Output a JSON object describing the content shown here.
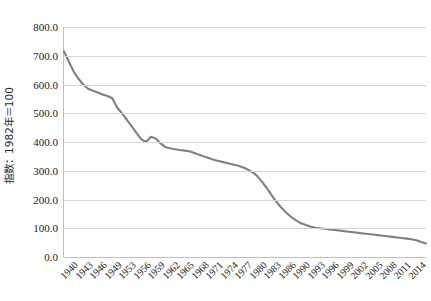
{
  "chart_data": {
    "type": "line",
    "title": "",
    "subtitle": "",
    "xlabel": "",
    "ylabel": "指数：1982年＝100",
    "ylim": [
      0,
      800
    ],
    "ytick_labels": [
      "800.0",
      "700.0",
      "600.0",
      "500.0",
      "400.0",
      "300.0",
      "200.0",
      "100.0",
      "0.0"
    ],
    "ytick_values": [
      800,
      700,
      600,
      500,
      400,
      300,
      200,
      100,
      0
    ],
    "grid": true,
    "legend": "none",
    "line_color": "#808080",
    "grid_color": "#d5d5d5",
    "axis_color": "#bfbfbf",
    "xtick_labels": [
      "1940",
      "1943",
      "1946",
      "1949",
      "1953",
      "1956",
      "1959",
      "1962",
      "1965",
      "1968",
      "1971",
      "1974",
      "1977",
      "1980",
      "1983",
      "1986",
      "1990",
      "1993",
      "1996",
      "1999",
      "2002",
      "2005",
      "2008",
      "2011",
      "2014"
    ],
    "x": [
      1940,
      1941,
      1942,
      1943,
      1944,
      1945,
      1946,
      1947,
      1948,
      1949,
      1950,
      1951,
      1952,
      1953,
      1954,
      1955,
      1956,
      1957,
      1958,
      1959,
      1960,
      1961,
      1962,
      1963,
      1964,
      1965,
      1966,
      1967,
      1968,
      1969,
      1970,
      1971,
      1972,
      1973,
      1974,
      1975,
      1976,
      1977,
      1978,
      1979,
      1980,
      1981,
      1982,
      1983,
      1984,
      1985,
      1986,
      1987,
      1988,
      1989,
      1990,
      1991,
      1992,
      1993,
      1994,
      1995,
      1996,
      1997,
      1998,
      1999,
      2000,
      2001,
      2002,
      2003,
      2004,
      2005,
      2006,
      2007,
      2008,
      2009,
      2010,
      2011,
      2012,
      2013,
      2014,
      2015
    ],
    "values": [
      715,
      680,
      645,
      620,
      600,
      585,
      578,
      572,
      565,
      560,
      552,
      520,
      500,
      478,
      455,
      432,
      410,
      400,
      418,
      412,
      395,
      382,
      378,
      375,
      372,
      370,
      368,
      362,
      356,
      350,
      344,
      338,
      334,
      330,
      326,
      322,
      318,
      312,
      305,
      295,
      282,
      262,
      240,
      215,
      192,
      172,
      155,
      140,
      128,
      118,
      112,
      106,
      102,
      100,
      98,
      96,
      94,
      92,
      90,
      88,
      86,
      84,
      82,
      80,
      78,
      76,
      74,
      72,
      70,
      68,
      66,
      64,
      62,
      58,
      52,
      47
    ],
    "xlim": [
      1940,
      2015
    ]
  }
}
